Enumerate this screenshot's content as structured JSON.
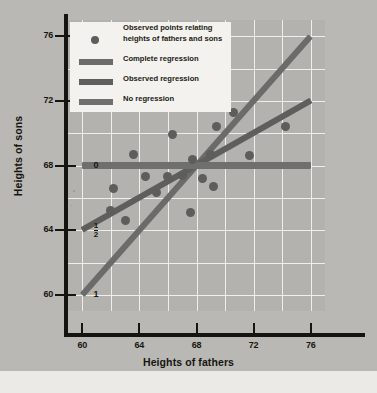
{
  "chart_data": {
    "type": "scatter",
    "title": "",
    "xlabel": "Heights of fathers",
    "ylabel": "Heights of sons",
    "xlim": [
      59,
      77
    ],
    "ylim": [
      59,
      77
    ],
    "xticks": [
      "60",
      "64",
      "68",
      "72",
      "76"
    ],
    "xtick_values": [
      60,
      64,
      68,
      72,
      76
    ],
    "yticks": [
      "76",
      "72",
      "68",
      "64",
      "60"
    ],
    "ytick_values": [
      76,
      72,
      68,
      64,
      60
    ],
    "grid": true,
    "legend_position": "top-left",
    "inner_marks": [
      {
        "label": "0",
        "y_value": 68,
        "meaning": "regression-coefficient-zero"
      },
      {
        "label": "1/2",
        "y_value": 64,
        "meaning": "regression-coefficient-one-half"
      },
      {
        "label": "1",
        "y_value": 60,
        "meaning": "regression-coefficient-one"
      }
    ],
    "series": [
      {
        "name": "Observed points relating heights of fathers and sons",
        "type": "scatter",
        "color": "#5d5d5c",
        "points": [
          [
            62.0,
            65.2
          ],
          [
            62.2,
            66.6
          ],
          [
            63.0,
            64.6
          ],
          [
            63.6,
            68.7
          ],
          [
            64.4,
            67.3
          ],
          [
            65.2,
            66.3
          ],
          [
            66.0,
            67.3
          ],
          [
            66.3,
            69.9
          ],
          [
            67.0,
            67.4
          ],
          [
            67.6,
            65.1
          ],
          [
            67.7,
            68.4
          ],
          [
            68.4,
            67.2
          ],
          [
            69.0,
            68.7
          ],
          [
            69.2,
            66.7
          ],
          [
            69.4,
            70.4
          ],
          [
            70.6,
            71.3
          ],
          [
            71.7,
            68.6
          ],
          [
            74.2,
            70.4
          ]
        ]
      },
      {
        "name": "Complete regression",
        "type": "line",
        "color": "#6b6b6a",
        "slope": 1.0,
        "endpoints": [
          [
            60.0,
            60.0
          ],
          [
            76.0,
            76.0
          ]
        ]
      },
      {
        "name": "Observed regression",
        "type": "line",
        "color": "#5e5e5d",
        "slope": 0.5,
        "endpoints": [
          [
            60.0,
            64.0
          ],
          [
            76.0,
            72.0
          ]
        ]
      },
      {
        "name": "No regression",
        "type": "line",
        "color": "#6f6f6e",
        "slope": 0.0,
        "endpoints": [
          [
            60.0,
            68.0
          ],
          [
            76.0,
            68.0
          ]
        ]
      }
    ]
  },
  "legend": {
    "items": [
      {
        "marker": "dot",
        "line1": "Observed points relating",
        "line2": "heights of fathers and sons"
      },
      {
        "marker": "bar",
        "line1": "Complete regression",
        "line2": ""
      },
      {
        "marker": "bar",
        "line1": "Observed regression",
        "line2": ""
      },
      {
        "marker": "bar",
        "line1": "No regression",
        "line2": ""
      }
    ]
  },
  "colors": {
    "page_background": "#b9b8b4",
    "plot_background": "#b3b2ae",
    "gridline": "#efeeea",
    "axis": "#15140f",
    "marker": "#5d5d5c",
    "legend_background": "#f3f2ee",
    "text": "#16150f"
  }
}
